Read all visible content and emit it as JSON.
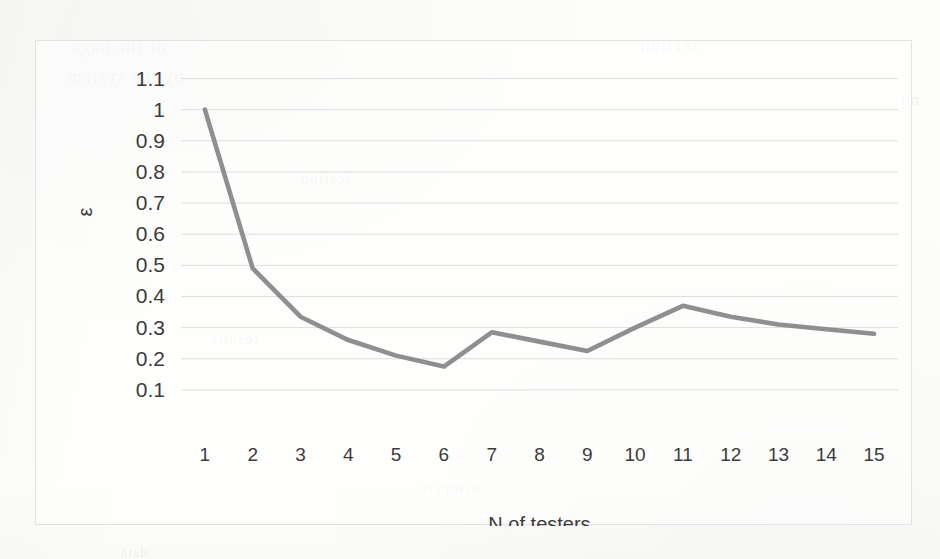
{
  "figure": {
    "background_color": "#fdfdfb",
    "frame_border_color": "#e3e3e1",
    "bleed_through_fragments": [
      "of the page",
      "by the system",
      "testing",
      "results",
      "section",
      "estimate",
      "no",
      "data"
    ]
  },
  "chart_data": {
    "type": "line",
    "title": "",
    "subtitle": "",
    "xlabel": "N of testers",
    "ylabel": "ε",
    "x": [
      1,
      2,
      3,
      4,
      5,
      6,
      7,
      8,
      9,
      10,
      11,
      12,
      13,
      14,
      15
    ],
    "xtick_labels": [
      "1",
      "2",
      "3",
      "4",
      "5",
      "6",
      "7",
      "8",
      "9",
      "10",
      "11",
      "12",
      "13",
      "14",
      "15"
    ],
    "values": [
      1.0,
      0.49,
      0.335,
      0.26,
      0.21,
      0.175,
      0.285,
      0.255,
      0.225,
      0.3,
      0.37,
      0.335,
      0.31,
      0.295,
      0.28
    ],
    "series": [
      {
        "name": "ε",
        "color": "#808080",
        "line_width": 4.6,
        "markers": false,
        "values": [
          1.0,
          0.49,
          0.335,
          0.26,
          0.21,
          0.175,
          0.285,
          0.255,
          0.225,
          0.3,
          0.37,
          0.335,
          0.31,
          0.295,
          0.28
        ]
      }
    ],
    "ytick_labels": [
      "0.1",
      "0.2",
      "0.3",
      "0.4",
      "0.5",
      "0.6",
      "0.7",
      "0.8",
      "0.9",
      "1",
      "1.1"
    ],
    "ytick_values": [
      0.1,
      0.2,
      0.3,
      0.4,
      0.5,
      0.6,
      0.7,
      0.8,
      0.9,
      1.0,
      1.1
    ],
    "ylim": [
      0.0,
      1.15
    ],
    "xlim": [
      0.5,
      15.5
    ],
    "grid": "horizontal",
    "grid_color": "#dedede",
    "legend": "none",
    "legend_position": "none",
    "annotations": []
  }
}
